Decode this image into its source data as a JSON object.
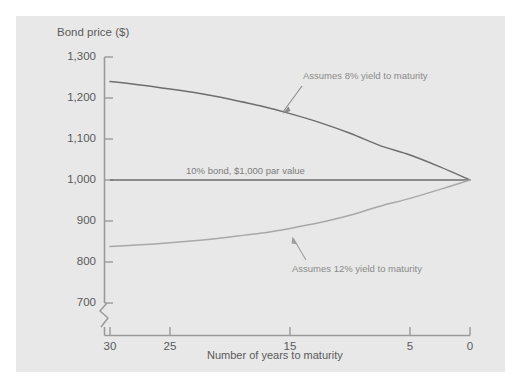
{
  "figure": {
    "background": "#ffffff",
    "panel_color": "#e8e8e8",
    "axis_color": "#9a9a9a",
    "text_color": "#5a5a5a",
    "annotation_color": "#8a8a8a"
  },
  "chart_data": {
    "type": "line",
    "title": "",
    "ylabel": "Bond price ($)",
    "xlabel": "Number of years to maturity",
    "ylim": [
      700,
      1300
    ],
    "xlim": [
      30,
      0
    ],
    "x_axis_reversed": true,
    "y_axis_break": true,
    "grid": false,
    "legend_position": "inline-annotations",
    "y_ticks": [
      700,
      800,
      900,
      1000,
      1100,
      1200,
      1300
    ],
    "y_tick_labels": [
      "700",
      "800",
      "900",
      "1,000",
      "1,100",
      "1,200",
      "1,300"
    ],
    "x_ticks": [
      30,
      25,
      15,
      5,
      0
    ],
    "x_tick_labels": [
      "30",
      "25",
      "15",
      "5",
      "0"
    ],
    "series": [
      {
        "name": "Assumes 8% yield to maturity",
        "color": "#6e6e6e",
        "x": [
          30,
          27.5,
          25,
          22.5,
          20,
          17.5,
          15,
          12.5,
          10,
          7.5,
          5,
          2.5,
          0
        ],
        "values": [
          1240,
          1232,
          1222,
          1211,
          1197,
          1181,
          1162,
          1140,
          1114,
          1084,
          1061,
          1032,
          1000
        ]
      },
      {
        "name": "10% bond, $1,000 par value",
        "color": "#6e6e6e",
        "x": [
          30,
          0
        ],
        "values": [
          1000,
          1000
        ]
      },
      {
        "name": "Assumes 12% yield to maturity",
        "color": "#a8a8a8",
        "x": [
          30,
          27.5,
          25,
          22.5,
          20,
          17.5,
          15,
          12.5,
          10,
          7.5,
          5,
          2.5,
          0
        ],
        "values": [
          838,
          842,
          847,
          853,
          861,
          870,
          882,
          896,
          914,
          936,
          955,
          977,
          1000
        ]
      }
    ],
    "annotations": [
      {
        "text": "Assumes 8% yield to maturity",
        "arrow": "down-left"
      },
      {
        "text": "10% bond, $1,000 par value",
        "arrow": "none"
      },
      {
        "text": "Assumes 12% yield to maturity",
        "arrow": "up-left"
      }
    ]
  }
}
